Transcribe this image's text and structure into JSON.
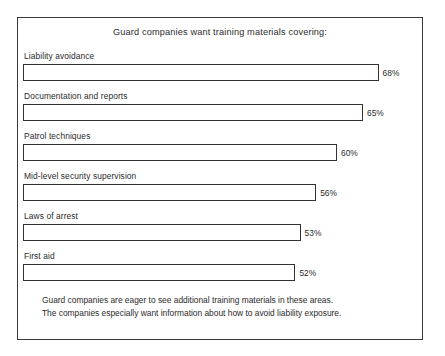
{
  "chart_data": {
    "type": "bar",
    "orientation": "horizontal",
    "title": "Guard companies want training materials covering:",
    "xlabel": "",
    "ylabel": "",
    "grid": false,
    "legend": null,
    "value_suffix": "%",
    "xlim": [
      50,
      70
    ],
    "categories": [
      "Liability avoidance",
      "Documentation and reports",
      "Patrol techniques",
      "Mid-level security supervision",
      "Laws of arrest",
      "First aid"
    ],
    "values": [
      68,
      65,
      60,
      56,
      53,
      52
    ],
    "value_labels": [
      "68%",
      "65%",
      "60%",
      "56%",
      "53%",
      "52%"
    ],
    "bars": [
      {
        "label": "Liability avoidance",
        "value": 68,
        "value_label": "68%"
      },
      {
        "label": "Documentation and reports",
        "value": 65,
        "value_label": "65%"
      },
      {
        "label": "Patrol techniques",
        "value": 60,
        "value_label": "60%"
      },
      {
        "label": "Mid-level security supervision",
        "value": 56,
        "value_label": "56%"
      },
      {
        "label": "Laws of arrest",
        "value": 53,
        "value_label": "53%"
      },
      {
        "label": "First aid",
        "value": 52,
        "value_label": "52%"
      }
    ],
    "annotations": [
      "Guard companies are eager to see additional training materials in these areas.",
      "The companies especially want information about how to avoid liability exposure."
    ]
  },
  "style": {
    "background": "#ffffff",
    "frame_color": "#3a3a3a",
    "bar_border_color": "#333333",
    "bar_fill": "#ffffff",
    "text_color": "#2b2b2b"
  },
  "footer": {
    "line1": "Guard companies are eager to see additional training materials in these areas.",
    "line2": "The companies especially want information about how to avoid liability exposure."
  }
}
